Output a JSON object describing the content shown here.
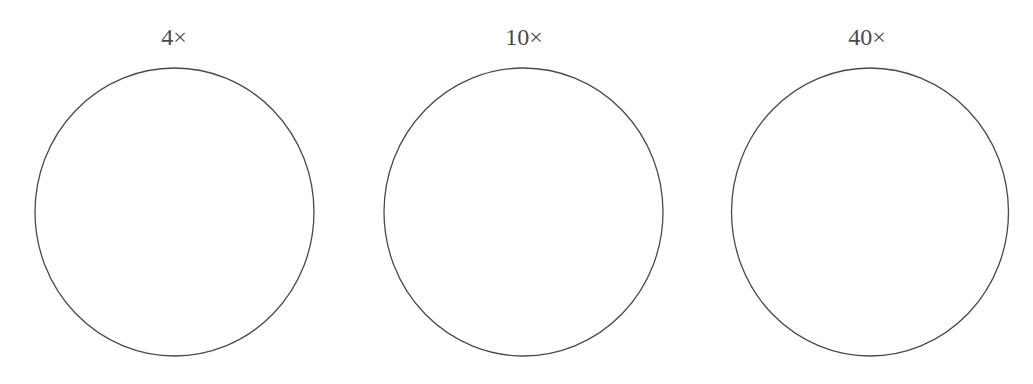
{
  "diagram": {
    "panels": [
      {
        "label": "4×",
        "cx": 174.5,
        "cy": 212,
        "rx": 139.5,
        "ry": 144
      },
      {
        "label": "10×",
        "cx": 523.5,
        "cy": 212,
        "rx": 139.5,
        "ry": 144
      },
      {
        "label": "40×",
        "cx": 870,
        "cy": 212,
        "rx": 138.5,
        "ry": 144
      }
    ],
    "stroke_color": "#4a4a4a",
    "label_color": "#4a4a4a",
    "background": "#ffffff"
  }
}
